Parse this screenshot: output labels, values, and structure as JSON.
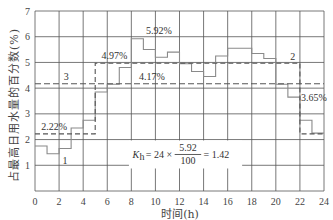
{
  "chart_data": {
    "type": "line",
    "subtype": "step",
    "title": "",
    "xlabel": "时间(h)",
    "ylabel": "占最高日用水量的百分数(%)",
    "xlim": [
      0,
      24
    ],
    "ylim": [
      0,
      7
    ],
    "x_ticks": [
      0,
      2,
      4,
      6,
      8,
      10,
      12,
      14,
      16,
      18,
      20,
      22,
      24
    ],
    "y_ticks": [
      1,
      2,
      3,
      4,
      5,
      6,
      7
    ],
    "grid": true,
    "series": [
      {
        "name": "1",
        "style": "solid-step",
        "color": "#888888",
        "hours": [
          0,
          1,
          2,
          3,
          4,
          5,
          6,
          7,
          8,
          9,
          10,
          11,
          12,
          13,
          14,
          15,
          16,
          17,
          18,
          19,
          20,
          21,
          22,
          23
        ],
        "values": [
          1.75,
          1.45,
          1.65,
          2.45,
          2.75,
          3.85,
          4.15,
          4.8,
          5.92,
          5.5,
          5.2,
          5.4,
          4.95,
          4.65,
          4.45,
          5.25,
          5.55,
          5.55,
          5.35,
          5.15,
          4.15,
          3.65,
          2.75,
          2.25
        ]
      },
      {
        "name": "2",
        "style": "dashed-step",
        "color": "#666666",
        "segments": [
          {
            "from": 0,
            "to": 5,
            "value": 2.22
          },
          {
            "from": 5,
            "to": 22,
            "value": 4.97
          },
          {
            "from": 22,
            "to": 24,
            "value": 2.22
          }
        ]
      },
      {
        "name": "3",
        "style": "dashed",
        "color": "#666666",
        "segments": [
          {
            "from": 0,
            "to": 24,
            "value": 4.17
          }
        ]
      }
    ],
    "annotations": [
      {
        "text": "5.92%",
        "x": 10.2,
        "y": 6.15
      },
      {
        "text": "4.97%",
        "x": 6.7,
        "y": 5.15
      },
      {
        "text": "4.17%",
        "x": 9.5,
        "y": 4.35
      },
      {
        "text": "2.22%",
        "x": 1.4,
        "y": 2.4
      },
      {
        "text": "3.65%",
        "x": 22.9,
        "y": 3.45
      },
      {
        "text": "1",
        "x": 2.5,
        "y": 1.1
      },
      {
        "text": "2",
        "x": 21.2,
        "y": 5.1
      },
      {
        "text": "3",
        "x": 2.6,
        "y": 4.3
      },
      {
        "text": "K_h = 24 × 5.92/100 = 1.42",
        "x": 13,
        "y": 1.42
      }
    ]
  },
  "labels": {
    "xlabel": "时间(h)",
    "ylabel": "占最高日用水量的百分数(%)",
    "formula_k": "K",
    "formula_sub": "h",
    "formula_eq": "= 24 ×",
    "formula_num": "5.92",
    "formula_den": "100",
    "formula_res": "= 1.42",
    "ann_592": "5.92%",
    "ann_497": "4.97%",
    "ann_417": "4.17%",
    "ann_222": "2.22%",
    "ann_365": "3.65%",
    "curve1": "1",
    "curve2": "2",
    "curve3": "3"
  }
}
